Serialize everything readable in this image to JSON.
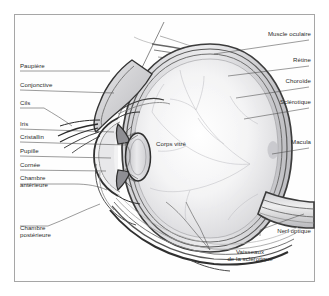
{
  "figure": {
    "title_visible": false,
    "language": "fr",
    "frame_color": "#a6a6a6",
    "background_color": "#ffffff",
    "label_color": "#2b2b2b",
    "ink_color": "#3a3a3a"
  },
  "labels": {
    "left": [
      {
        "name": "paupiere",
        "text": "Paupière",
        "x": 20,
        "y": 66,
        "leader_to_x": 96,
        "leader_to_y": 72
      },
      {
        "name": "conjonctive",
        "text": "Conjonctive",
        "x": 20,
        "y": 85,
        "leader_to_x": 100,
        "leader_to_y": 94
      },
      {
        "name": "cils",
        "text": "Cils",
        "x": 20,
        "y": 103,
        "leader_to_x": 68,
        "leader_to_y": 116
      },
      {
        "name": "iris",
        "text": "Iris",
        "x": 20,
        "y": 124,
        "leader_to_x": 100,
        "leader_to_y": 128
      },
      {
        "name": "cristallin",
        "text": "Cristallin",
        "x": 20,
        "y": 137,
        "leader_to_x": 112,
        "leader_to_y": 141
      },
      {
        "name": "pupille",
        "text": "Pupille",
        "x": 20,
        "y": 151,
        "leader_to_x": 97,
        "leader_to_y": 154
      },
      {
        "name": "cornee",
        "text": "Cornée",
        "x": 20,
        "y": 165,
        "leader_to_x": 92,
        "leader_to_y": 167
      },
      {
        "name": "chambre-anterieure",
        "text": "Chambre\nantérieure",
        "x": 20,
        "y": 178,
        "leader_to_x": 93,
        "leader_to_y": 180
      },
      {
        "name": "chambre-posterieure",
        "text": "Chambre\npostérieure",
        "x": 20,
        "y": 228,
        "leader_to_x": 95,
        "leader_to_y": 196
      }
    ],
    "right": [
      {
        "name": "muscle-oculaire",
        "text": "Muscle oculaire",
        "x": 232,
        "y": 32,
        "leader_to_x": 196,
        "leader_to_y": 43
      },
      {
        "name": "retine",
        "text": "Rétine",
        "x": 268,
        "y": 58,
        "leader_to_x": 214,
        "leader_to_y": 65
      },
      {
        "name": "choroide",
        "text": "Choroïde",
        "x": 258,
        "y": 79,
        "leader_to_x": 221,
        "leader_to_y": 86
      },
      {
        "name": "sclerotique",
        "text": "Sclérotique",
        "x": 248,
        "y": 100,
        "leader_to_x": 228,
        "leader_to_y": 107
      },
      {
        "name": "macula",
        "text": "Macula",
        "x": 266,
        "y": 140,
        "leader_to_x": 230,
        "leader_to_y": 147
      },
      {
        "name": "nerf-optique",
        "text": "Nerf optique",
        "x": 250,
        "y": 231,
        "leader_to_x": 288,
        "leader_to_y": 216
      },
      {
        "name": "vaisseaux-sclerotique",
        "text": "Vaisseaux\nde la sclérotique",
        "x": 200,
        "y": 252,
        "leader_to_x": 182,
        "leader_to_y": 214
      }
    ],
    "center": [
      {
        "name": "corps-vitre",
        "text": "Corps vitré",
        "x": 158,
        "y": 143
      }
    ]
  },
  "anatomy_parts": [
    "Paupière",
    "Conjonctive",
    "Cils",
    "Iris",
    "Cristallin",
    "Pupille",
    "Cornée",
    "Chambre antérieure",
    "Chambre postérieure",
    "Corps vitré",
    "Muscle oculaire",
    "Rétine",
    "Choroïde",
    "Sclérotique",
    "Macula",
    "Nerf optique",
    "Vaisseaux de la sclérotique"
  ]
}
